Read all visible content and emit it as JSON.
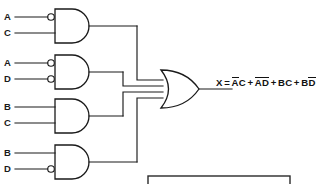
{
  "diagram": {
    "line_color": "#1a1a1a",
    "background": "#ffffff",
    "gates": [
      {
        "id": "gate-1",
        "type": "and-gate",
        "inputs": [
          {
            "label": "A",
            "inverted": true
          },
          {
            "label": "C",
            "inverted": false
          }
        ],
        "term": "AC"
      },
      {
        "id": "gate-2",
        "type": "and-gate",
        "inputs": [
          {
            "label": "A",
            "inverted": true
          },
          {
            "label": "D",
            "inverted": true
          }
        ],
        "term": "AD"
      },
      {
        "id": "gate-3",
        "type": "and-gate",
        "inputs": [
          {
            "label": "B",
            "inverted": false
          },
          {
            "label": "C",
            "inverted": false
          }
        ],
        "term": "BC"
      },
      {
        "id": "gate-4",
        "type": "and-gate",
        "inputs": [
          {
            "label": "B",
            "inverted": false
          },
          {
            "label": "D",
            "inverted": true
          }
        ],
        "term": "BD"
      }
    ],
    "or_gate": {
      "id": "or-gate",
      "type": "or-gate",
      "input_count": 4
    },
    "input_labels": {
      "gate1_top": "A",
      "gate1_bottom": "C",
      "gate2_top": "A",
      "gate2_bottom": "D",
      "gate3_top": "B",
      "gate3_bottom": "C",
      "gate4_top": "B",
      "gate4_bottom": "D"
    },
    "output": {
      "variable": "X",
      "equals": "=",
      "plus": "+",
      "terms": [
        {
          "first": "A",
          "first_bar": true,
          "second": "C",
          "second_bar": false
        },
        {
          "first": "A",
          "first_bar": true,
          "second": "D",
          "second_bar": true
        },
        {
          "first": "B",
          "first_bar": false,
          "second": "C",
          "second_bar": false
        },
        {
          "first": "B",
          "first_bar": false,
          "second": "D",
          "second_bar": true
        }
      ],
      "equation_plain": "X = AC + AD + BC + BD"
    }
  }
}
